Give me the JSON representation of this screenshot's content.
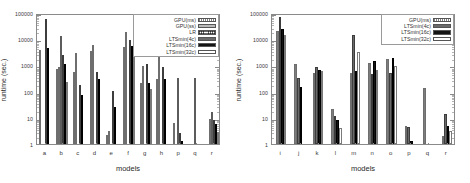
{
  "figure": {
    "background": "#ffffff",
    "panels": [
      {
        "id": "left",
        "axis": {
          "ylabel": "runtime (sec.)",
          "xlabel": "models",
          "yticks": [
            "1",
            "10",
            "100",
            "1000",
            "10000",
            "100000"
          ],
          "ylim": [
            1,
            100000
          ],
          "grid": false
        },
        "legend": {
          "position": "top-right",
          "entries": [
            {
              "label": "GPU(ms)",
              "style": "f-gpums"
            },
            {
              "label": "GPU(ss)",
              "style": "f-gpuss"
            },
            {
              "label": "LR",
              "style": "f-lr"
            },
            {
              "label": "LTSmin(4c)",
              "style": "f-l4"
            },
            {
              "label": "LTSmin(16c)",
              "style": "f-l16"
            },
            {
              "label": "LTSmin(32c)",
              "style": "f-l32"
            }
          ]
        },
        "categories": [
          "a",
          "b",
          "c",
          "d",
          "e",
          "f",
          "g",
          "h",
          "p",
          "q",
          "r"
        ]
      },
      {
        "id": "right",
        "axis": {
          "ylabel": "runtime (sec.)",
          "xlabel": "models",
          "yticks": [
            "1",
            "10",
            "100",
            "1000",
            "10000",
            "100000"
          ],
          "ylim": [
            1,
            100000
          ],
          "grid": false
        },
        "legend": {
          "position": "top-right",
          "entries": [
            {
              "label": "GPU(ms)",
              "style": "f-gpums"
            },
            {
              "label": "LTSmin(4c)",
              "style": "f-l4"
            },
            {
              "label": "LTSmin(16c)",
              "style": "f-l16"
            },
            {
              "label": "LTSmin(32c)",
              "style": "f-l32"
            }
          ]
        },
        "categories": [
          "i",
          "j",
          "k",
          "l",
          "m",
          "n",
          "o",
          "p",
          "q",
          "r"
        ]
      }
    ]
  },
  "chart_data": [
    {
      "type": "bar",
      "title": "",
      "xlabel": "models",
      "ylabel": "runtime (sec.)",
      "yscale": "log",
      "ylim": [
        1,
        100000
      ],
      "yticks": [
        1,
        10,
        100,
        1000,
        10000,
        100000
      ],
      "grid": false,
      "legend_position": "top-right",
      "categories": [
        "a",
        "b",
        "c",
        "d",
        "e",
        "f",
        "g",
        "h",
        "p",
        "q",
        "r"
      ],
      "series": [
        {
          "name": "GPU(ms)",
          "values": [
            4000,
            750,
            570,
            3400,
            2.2,
            5000,
            210,
            300,
            6.5,
            null,
            null
          ]
        },
        {
          "name": "GPU(ss)",
          "values": [
            null,
            900,
            3100,
            6000,
            3.1,
            19000,
            950,
            2200,
            null,
            null,
            9.0
          ]
        },
        {
          "name": "LR",
          "values": [
            null,
            13000,
            null,
            null,
            null,
            null,
            null,
            null,
            340,
            330,
            17.0
          ]
        },
        {
          "name": "LTSmin(4c)",
          "values": [
            60000,
            2400,
            185,
            560,
            110,
            9200,
            1100,
            900,
            2.7,
            null,
            8.5
          ]
        },
        {
          "name": "LTSmin(16c)",
          "values": [
            4500,
            1100,
            76,
            295,
            25,
            5500,
            215,
            310,
            1.25,
            null,
            6.0
          ]
        },
        {
          "name": "LTSmin(32c)",
          "values": [
            null,
            230,
            null,
            null,
            null,
            3200,
            130,
            null,
            null,
            null,
            2.9
          ]
        }
      ]
    },
    {
      "type": "bar",
      "title": "",
      "xlabel": "models",
      "ylabel": "runtime (sec.)",
      "yscale": "log",
      "ylim": [
        1,
        100000
      ],
      "yticks": [
        1,
        10,
        100,
        1000,
        10000,
        100000
      ],
      "grid": false,
      "legend_position": "top-right",
      "categories": [
        "i",
        "j",
        "k",
        "l",
        "m",
        "n",
        "o",
        "p",
        "q",
        "r"
      ],
      "series": [
        {
          "name": "GPU(ms)",
          "values": [
            21000,
            1100,
            520,
            21,
            520,
            1200,
            1700,
            5.0,
            140,
            2.1
          ]
        },
        {
          "name": "LTSmin(4c)",
          "values": [
            70000,
            320,
            880,
            11.5,
            15000,
            490,
            520,
            4.5,
            null,
            13.5
          ]
        },
        {
          "name": "LTSmin(16c)",
          "values": [
            25000,
            145,
            650,
            8.5,
            620,
            1500,
            1900,
            1.35,
            null,
            4.8
          ]
        },
        {
          "name": "LTSmin(32c)",
          "values": [
            14000,
            null,
            620,
            4.2,
            3300,
            690,
            980,
            null,
            null,
            3.2
          ]
        }
      ]
    }
  ]
}
